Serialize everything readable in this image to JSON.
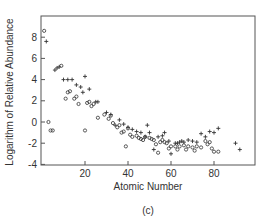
{
  "chart_data": {
    "type": "scatter",
    "title": "",
    "caption": "(c)",
    "xlabel": "Atomic Number",
    "ylabel": "Logarithm of Relative Abundance",
    "xlim": [
      0,
      100
    ],
    "ylim": [
      -4,
      10
    ],
    "xticks": [
      20,
      40,
      60,
      80
    ],
    "xtick_labels": [
      "20",
      "40",
      "60",
      "80"
    ],
    "yticks": [
      8,
      6,
      4,
      2,
      0,
      -2,
      -4
    ],
    "ytick_labels": [
      "8",
      "6",
      "4",
      "2",
      "0",
      "-2",
      "-4"
    ],
    "grid": false,
    "legend": null,
    "series": [
      {
        "name": "circles",
        "marker": "o",
        "points": [
          [
            1,
            8.6
          ],
          [
            3,
            0.0
          ],
          [
            4,
            -0.8
          ],
          [
            5,
            -0.8
          ],
          [
            9,
            5.3
          ],
          [
            11,
            2.2
          ],
          [
            12,
            2.8
          ],
          [
            13,
            2.9
          ],
          [
            15,
            2.2
          ],
          [
            16,
            2.4
          ],
          [
            17,
            1.7
          ],
          [
            21,
            1.8
          ],
          [
            22,
            1.9
          ],
          [
            23,
            1.5
          ],
          [
            24,
            1.7
          ],
          [
            20,
            -0.8
          ],
          [
            26,
            0.4
          ],
          [
            29,
            0.7
          ],
          [
            31,
            0.3
          ],
          [
            32,
            0.6
          ],
          [
            33,
            -0.1
          ],
          [
            35,
            -0.5
          ],
          [
            36,
            -0.3
          ],
          [
            37,
            -1.0
          ],
          [
            38,
            -0.9
          ],
          [
            39,
            -2.3
          ],
          [
            40,
            -0.6
          ],
          [
            41,
            -1.2
          ],
          [
            42,
            -1.4
          ],
          [
            44,
            -1.3
          ],
          [
            45,
            -1.5
          ],
          [
            46,
            -1.6
          ],
          [
            47,
            -1.7
          ],
          [
            48,
            -1.4
          ],
          [
            50,
            -1.5
          ],
          [
            51,
            -1.6
          ],
          [
            52,
            -1.7
          ],
          [
            53,
            -2.1
          ],
          [
            55,
            -1.9
          ],
          [
            56,
            -1.7
          ],
          [
            57,
            -1.9
          ],
          [
            58,
            -2.0
          ],
          [
            59,
            -2.5
          ],
          [
            60,
            -2.3
          ],
          [
            62,
            -2.3
          ],
          [
            63,
            -2.6
          ],
          [
            64,
            -2.3
          ],
          [
            66,
            -2.2
          ],
          [
            67,
            -2.6
          ],
          [
            68,
            -2.3
          ],
          [
            70,
            -2.4
          ],
          [
            71,
            -2.7
          ],
          [
            72,
            -2.3
          ],
          [
            74,
            -2.4
          ],
          [
            76,
            -1.8
          ],
          [
            77,
            -2.1
          ],
          [
            78,
            -1.9
          ],
          [
            79,
            -2.5
          ],
          [
            80,
            -2.8
          ],
          [
            82,
            -2.8
          ],
          [
            54,
            -2.9
          ]
        ]
      },
      {
        "name": "crosses",
        "marker": "+",
        "points": [
          [
            2,
            7.6
          ],
          [
            6,
            4.9
          ],
          [
            7,
            5.1
          ],
          [
            8,
            5.2
          ],
          [
            10,
            4.0
          ],
          [
            12,
            4.0
          ],
          [
            14,
            4.0
          ],
          [
            16,
            3.5
          ],
          [
            18,
            3.3
          ],
          [
            19,
            2.8
          ],
          [
            20,
            4.3
          ],
          [
            22,
            3.1
          ],
          [
            25,
            1.9
          ],
          [
            26,
            1.9
          ],
          [
            30,
            0.9
          ],
          [
            32,
            0.7
          ],
          [
            34,
            -0.3
          ],
          [
            36,
            0.2
          ],
          [
            38,
            -0.2
          ],
          [
            40,
            -0.5
          ],
          [
            42,
            -0.7
          ],
          [
            44,
            -0.9
          ],
          [
            46,
            -1.0
          ],
          [
            48,
            -1.4
          ],
          [
            50,
            -1.0
          ],
          [
            49,
            -0.3
          ],
          [
            52,
            -2.6
          ],
          [
            54,
            -1.4
          ],
          [
            56,
            -1.3
          ],
          [
            57,
            -1.0
          ],
          [
            59,
            -1.8
          ],
          [
            60,
            -3.0
          ],
          [
            62,
            -2.0
          ],
          [
            63,
            -2.0
          ],
          [
            64,
            -1.9
          ],
          [
            65,
            -1.8
          ],
          [
            66,
            -1.9
          ],
          [
            68,
            -1.7
          ],
          [
            70,
            -1.8
          ],
          [
            72,
            -1.9
          ],
          [
            74,
            -1.1
          ],
          [
            76,
            -1.4
          ],
          [
            78,
            -0.9
          ],
          [
            80,
            -1.0
          ],
          [
            82,
            -0.6
          ],
          [
            90,
            -2.0
          ],
          [
            92,
            -2.6
          ]
        ]
      }
    ]
  }
}
